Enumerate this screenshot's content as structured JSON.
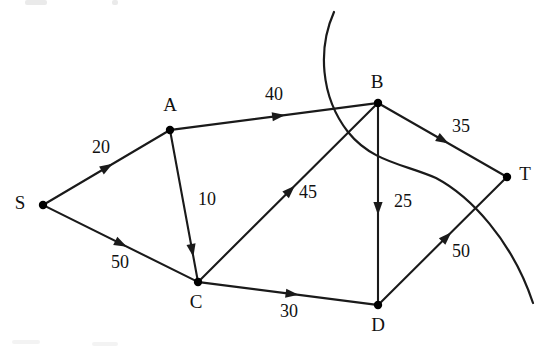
{
  "figure": {
    "type": "directed-weighted-graph",
    "background_color": "#ffffff",
    "ink_color": "#1a1a1a"
  },
  "nodes": [
    {
      "id": "S",
      "label": "S",
      "x": 43,
      "y": 205,
      "label_x": 20,
      "label_y": 205
    },
    {
      "id": "A",
      "label": "A",
      "x": 170,
      "y": 130,
      "label_x": 170,
      "label_y": 107
    },
    {
      "id": "B",
      "label": "B",
      "x": 378,
      "y": 103,
      "label_x": 377,
      "label_y": 84
    },
    {
      "id": "C",
      "label": "C",
      "x": 198,
      "y": 282,
      "label_x": 196,
      "label_y": 304
    },
    {
      "id": "D",
      "label": "D",
      "x": 378,
      "y": 305,
      "label_x": 378,
      "label_y": 327
    },
    {
      "id": "T",
      "label": "T",
      "x": 507,
      "y": 177,
      "label_x": 525,
      "label_y": 176
    }
  ],
  "edges": [
    {
      "from": "S",
      "to": "A",
      "weight": "20",
      "label_x": 101,
      "label_y": 149,
      "arrow_t": 0.5
    },
    {
      "from": "S",
      "to": "C",
      "weight": "50",
      "label_x": 120,
      "label_y": 264,
      "arrow_t": 0.5
    },
    {
      "from": "A",
      "to": "B",
      "weight": "40",
      "label_x": 274,
      "label_y": 96,
      "arrow_t": 0.52
    },
    {
      "from": "A",
      "to": "C",
      "weight": "10",
      "label_x": 207,
      "label_y": 201,
      "arrow_t": 0.8
    },
    {
      "from": "C",
      "to": "B",
      "weight": "45",
      "label_x": 308,
      "label_y": 194,
      "arrow_t": 0.51
    },
    {
      "from": "C",
      "to": "D",
      "weight": "30",
      "label_x": 289,
      "label_y": 313,
      "arrow_t": 0.52
    },
    {
      "from": "B",
      "to": "D",
      "weight": "25",
      "label_x": 403,
      "label_y": 203,
      "arrow_t": 0.52
    },
    {
      "from": "B",
      "to": "T",
      "weight": "35",
      "label_x": 461,
      "label_y": 128,
      "arrow_t": 0.5
    },
    {
      "from": "D",
      "to": "T",
      "weight": "50",
      "label_x": 461,
      "label_y": 253,
      "arrow_t": 0.53
    }
  ],
  "artifact_curve": {
    "name": "handwritten-curve-overlay",
    "path": "M 334 12 C 318 48, 320 96, 348 132 C 372 162, 404 164, 436 178 C 470 196, 512 240, 533 303"
  }
}
